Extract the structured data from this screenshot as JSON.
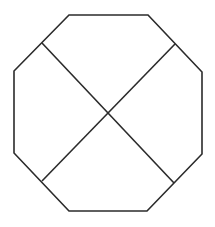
{
  "diagram": {
    "type": "geometric-figure",
    "shape": "octagon",
    "stroke_color": "#2b2b2b",
    "fill_color": "#ffffff",
    "background": "#ffffff",
    "stroke_width": 1.6,
    "octagon_vertices": [
      [
        69,
        15
      ],
      [
        148,
        15
      ],
      [
        202,
        72
      ],
      [
        202,
        154
      ],
      [
        147,
        211
      ],
      [
        69,
        211
      ],
      [
        14,
        153
      ],
      [
        14,
        71
      ]
    ],
    "diagonals": [
      {
        "name": "diagonal-top-left-to-bottom-right",
        "from": [
          42,
          43
        ],
        "to": [
          174,
          183
        ]
      },
      {
        "name": "diagonal-top-right-to-bottom-left",
        "from": [
          175,
          44
        ],
        "to": [
          42,
          181
        ]
      }
    ],
    "intersection": [
      108,
      113
    ]
  }
}
